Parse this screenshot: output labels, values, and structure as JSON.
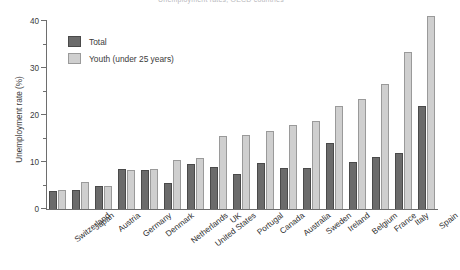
{
  "chart_data": {
    "type": "bar",
    "title": "Unemployment rates, OECD countries",
    "xlabel": "",
    "ylabel": "Unemployment rate (%)",
    "ylim": [
      0,
      40
    ],
    "yticks": [
      0,
      10,
      20,
      30,
      40
    ],
    "ytick_labels": [
      "0",
      "10",
      "20",
      "30",
      "40"
    ],
    "yminor_ticks": [
      5,
      15,
      25,
      35
    ],
    "grid": false,
    "legend_position": "upper-left-inside",
    "categories": [
      "Switzerland",
      "Japan",
      "Austria",
      "Germany",
      "Denmark",
      "Netherlands",
      "United States",
      "UK",
      "Portugal",
      "Canada",
      "Australia",
      "Sweden",
      "Ireland",
      "Belgium",
      "France",
      "Italy",
      "Spain"
    ],
    "series": [
      {
        "name": "Total",
        "color": "#6b6b6b",
        "values": [
          3.8,
          4.0,
          5.0,
          8.5,
          8.3,
          5.5,
          9.5,
          9.0,
          7.5,
          9.8,
          8.8,
          8.8,
          14.0,
          10.0,
          11.0,
          12.0,
          22.0
        ]
      },
      {
        "name": "Youth (under 25 years)",
        "color": "#cfcfcf",
        "values": [
          4.0,
          5.8,
          4.8,
          8.2,
          8.5,
          10.5,
          10.8,
          15.5,
          15.8,
          16.5,
          17.8,
          18.8,
          22.0,
          23.5,
          26.5,
          33.5,
          41.0
        ]
      }
    ]
  },
  "legend": {
    "items": [
      {
        "label": "Total",
        "key": "total"
      },
      {
        "label": "Youth (under 25 years)",
        "key": "youth"
      }
    ]
  },
  "axes": {
    "y_title": "Unemployment rate (%)"
  }
}
